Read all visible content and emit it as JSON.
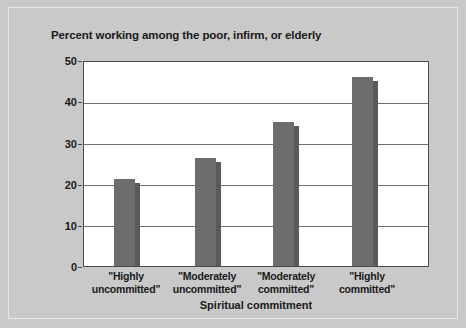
{
  "chart_data": {
    "type": "bar",
    "title": "Percent working among the poor, infirm, or elderly",
    "xlabel": "Spiritual commitment",
    "ylabel": "",
    "ylim": [
      0,
      50
    ],
    "yticks": [
      0,
      10,
      20,
      30,
      40,
      50
    ],
    "ytick_labels": [
      "0",
      "10",
      "20",
      "30",
      "40",
      "50"
    ],
    "grid": true,
    "legend": false,
    "categories": [
      "\"Highly uncommitted\"",
      "\"Moderately uncommitted\"",
      "\"Moderately committed\"",
      "\"Highly committed\""
    ],
    "category_lines": [
      [
        "\"Highly",
        "uncommitted\""
      ],
      [
        "\"Moderately",
        "uncommitted\""
      ],
      [
        "\"Moderately",
        "committed\""
      ],
      [
        "\"Highly",
        "committed\""
      ]
    ],
    "values": [
      21.4,
      26.5,
      35.4,
      46.3
    ],
    "bar_color": "#6d6d6d",
    "bar_side_color": "#5a5a5a"
  },
  "colors": {
    "background": "#c9c9c9",
    "plot_background": "#ffffff",
    "axis": "#4a4a4a",
    "gridline": "#6e6e6e",
    "text": "#1a1a1a"
  }
}
